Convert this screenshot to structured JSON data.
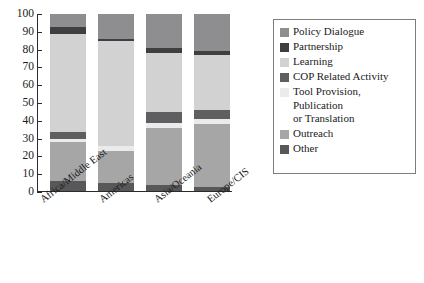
{
  "chart_data": {
    "type": "bar",
    "subtype": "stacked-bar-percent",
    "title": "",
    "xlabel": "",
    "ylabel": "",
    "ylim": [
      0,
      100
    ],
    "y_ticks": [
      0,
      10,
      20,
      30,
      40,
      50,
      60,
      70,
      80,
      90,
      100
    ],
    "grid": false,
    "legend_position": "right",
    "categories": [
      "Africa/Middle East",
      "Americas",
      "Asia/Oceania",
      "Europe/CIS"
    ],
    "stack_order_bottom_to_top": [
      "Other",
      "Outreach",
      "Tool Provision, Publication or Translation",
      "COP Related Activity",
      "Learning",
      "Partnership",
      "Policy Dialogue"
    ],
    "series": [
      {
        "name": "Other",
        "color": "#58585a",
        "values": [
          6,
          5,
          4,
          3
        ]
      },
      {
        "name": "Outreach",
        "color": "#a6a6a6",
        "values": [
          22,
          18,
          32,
          35
        ]
      },
      {
        "name": "Tool Provision, Publication or Translation",
        "color": "#ebebeb",
        "values": [
          2,
          3,
          3,
          3
        ]
      },
      {
        "name": "COP Related Activity",
        "color": "#5f5f61",
        "values": [
          4,
          0,
          6,
          5
        ]
      },
      {
        "name": "Learning",
        "color": "#d2d2d2",
        "values": [
          55,
          59,
          33,
          31
        ]
      },
      {
        "name": "Partnership",
        "color": "#3f3f41",
        "values": [
          4,
          1,
          3,
          2
        ]
      },
      {
        "name": "Policy Dialogue",
        "color": "#8e8e90",
        "values": [
          7,
          14,
          19,
          21
        ]
      }
    ]
  },
  "legend": {
    "entries": [
      {
        "label": "Policy Dialogue",
        "color": "#8e8e90"
      },
      {
        "label": "Partnership",
        "color": "#3f3f41"
      },
      {
        "label": "Learning",
        "color": "#d2d2d2"
      },
      {
        "label": "COP Related Activity",
        "color": "#5f5f61"
      },
      {
        "label": "Tool Provision,\nPublication\nor Translation",
        "color": "#ebebeb"
      },
      {
        "label": "Outreach",
        "color": "#a6a6a6"
      },
      {
        "label": "Other",
        "color": "#58585a"
      }
    ]
  },
  "axis": {
    "y_tick_labels": [
      "100",
      "90",
      "80",
      "70",
      "60",
      "50",
      "40",
      "30",
      "20",
      "10",
      "0"
    ],
    "x_category_labels": [
      "Africa/Middle East",
      "Americas",
      "Asia/Oceania",
      "Europe/CIS"
    ]
  },
  "colors": {
    "axis_line": "#2b2b2b",
    "legend_border": "#7d7d7d",
    "background": "#ffffff"
  }
}
